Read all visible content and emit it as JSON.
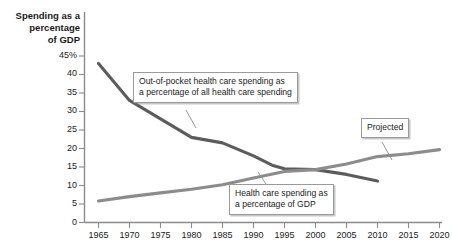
{
  "chart_data": {
    "type": "line",
    "title": "",
    "ylabel": "Spending as a percentage of GDP",
    "ylabel_lines": [
      "Spending as a",
      "percentage",
      "of GDP"
    ],
    "xlabel": "",
    "xlim": [
      1965,
      2020
    ],
    "ylim": [
      0,
      45
    ],
    "grid": false,
    "legend": "none",
    "yticks": [
      "0",
      "5",
      "10",
      "15",
      "20",
      "25",
      "30",
      "35",
      "40",
      "45%"
    ],
    "ytick_values": [
      0,
      5,
      10,
      15,
      20,
      25,
      30,
      35,
      40,
      45
    ],
    "xticks": [
      "1965",
      "1970",
      "1975",
      "1980",
      "1985",
      "1990",
      "1995",
      "2000",
      "2005",
      "2010",
      "2015",
      "2020"
    ],
    "xtick_values": [
      1965,
      1970,
      1975,
      1980,
      1985,
      1990,
      1995,
      2000,
      2005,
      2010,
      2015,
      2020
    ],
    "series": [
      {
        "name": "Out-of-pocket health care spending as a percentage of all health care spending",
        "color": "#5c5c5c",
        "x": [
          1965,
          1970,
          1975,
          1980,
          1985,
          1990,
          1993,
          1995,
          2000,
          2005,
          2010
        ],
        "values": [
          43.0,
          33.0,
          28.0,
          23.0,
          21.5,
          18.0,
          15.5,
          14.5,
          14.3,
          13.0,
          11.2
        ]
      },
      {
        "name": "Health care spending as a percentage of GDP",
        "color": "#8c8c8c",
        "x": [
          1965,
          1970,
          1975,
          1980,
          1985,
          1990,
          1995,
          2000,
          2005,
          2010,
          2015,
          2020
        ],
        "values": [
          5.8,
          7.0,
          8.0,
          9.0,
          10.2,
          12.0,
          13.8,
          14.3,
          15.8,
          17.8,
          18.6,
          19.7
        ]
      }
    ],
    "annotations": [
      {
        "id": "out-of-pocket",
        "lines": [
          "Out-of-pocket health care spending as",
          "a percentage of all health care spending"
        ]
      },
      {
        "id": "health-care-gdp",
        "lines": [
          "Health care spending as",
          "a percentage of GDP"
        ]
      },
      {
        "id": "projected",
        "lines": [
          "Projected"
        ]
      }
    ]
  }
}
